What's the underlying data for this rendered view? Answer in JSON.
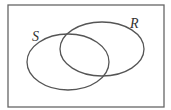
{
  "diagram": {
    "type": "venn",
    "universe": {
      "x": 8,
      "y": 5,
      "width": 156,
      "height": 102
    },
    "sets": [
      {
        "label": "S",
        "cx": 68,
        "cy": 62,
        "rx": 41,
        "ry": 28,
        "label_x": 32,
        "label_y": 41
      },
      {
        "label": "R",
        "cx": 102,
        "cy": 49,
        "rx": 42,
        "ry": 27,
        "label_x": 130,
        "label_y": 28
      }
    ],
    "stroke_color": "#555555"
  }
}
